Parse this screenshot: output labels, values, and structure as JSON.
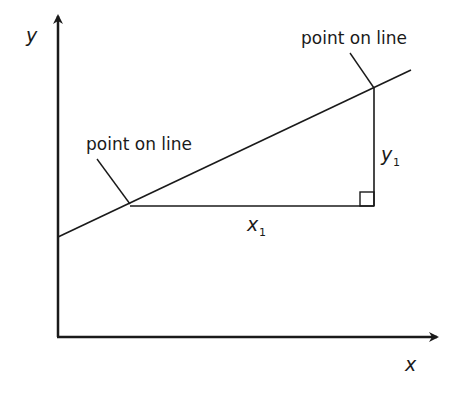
{
  "diagram": {
    "axes": {
      "x_label": "x",
      "y_label": "y"
    },
    "annotations": {
      "top_point_label": "point on line",
      "left_point_label": "point on line",
      "horizontal_run_label": "x",
      "horizontal_run_subscript": "1",
      "vertical_rise_label": "y",
      "vertical_rise_subscript": "1"
    },
    "colors": {
      "stroke": "#1a1a1a",
      "background": "#ffffff"
    }
  }
}
